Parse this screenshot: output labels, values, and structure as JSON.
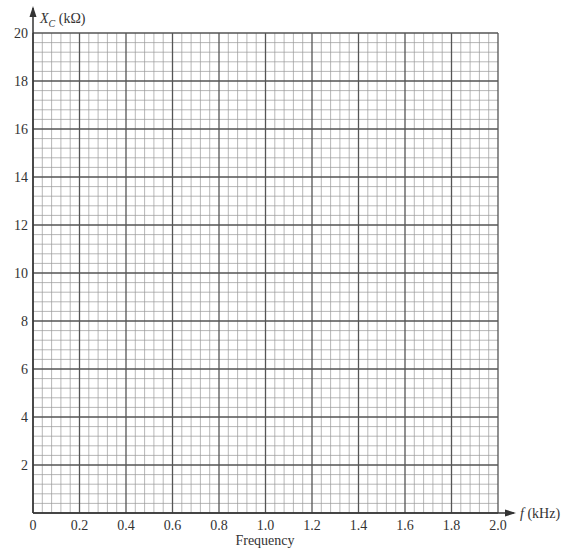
{
  "chart_data": {
    "type": "line",
    "title": "",
    "xlabel": "f (kHz)",
    "ylabel": "X_C (kΩ)",
    "x_caption": "Frequency",
    "xlim": [
      0,
      2.0
    ],
    "ylim": [
      0,
      20
    ],
    "x_ticks": [
      "0",
      "0.2",
      "0.4",
      "0.6",
      "0.8",
      "1.0",
      "1.2",
      "1.4",
      "1.6",
      "1.8",
      "2.0"
    ],
    "y_ticks": [
      "2",
      "4",
      "6",
      "8",
      "10",
      "12",
      "14",
      "16",
      "18",
      "20"
    ],
    "grid": true,
    "grid_minor_divisions": 5,
    "series": []
  },
  "axes": {
    "y_label_main": "X",
    "y_label_sub": "C",
    "y_label_unit": " (kΩ)",
    "x_label_var": "f",
    "x_label_unit": " (kHz)",
    "x_caption": "Frequency"
  },
  "colors": {
    "grid_minor": "#9a9a9a",
    "grid_major": "#555555",
    "axis": "#333333"
  }
}
